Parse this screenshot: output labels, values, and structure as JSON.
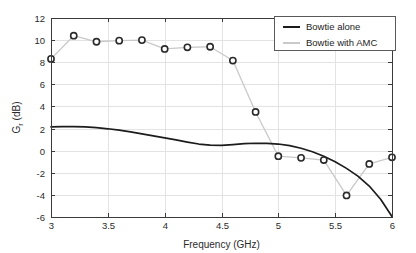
{
  "chart_data": {
    "type": "line",
    "title": "",
    "xlabel": "Frequency (GHz)",
    "ylabel": "G_r (dB)",
    "ylabel_base": "G",
    "ylabel_sub": "r",
    "ylabel_unit": " (dB)",
    "xlim": [
      3,
      6
    ],
    "ylim": [
      -6,
      12
    ],
    "xticks": [
      3,
      3.5,
      4,
      4.5,
      5,
      5.5,
      6
    ],
    "xtick_labels": [
      "3",
      "3.5",
      "4",
      "4.5",
      "5",
      "5.5",
      "6"
    ],
    "yticks": [
      -6,
      -4,
      -2,
      0,
      2,
      4,
      6,
      8,
      10,
      12
    ],
    "ytick_labels": [
      "-6",
      "-4",
      "-2",
      "0",
      "2",
      "4",
      "6",
      "8",
      "10",
      "12"
    ],
    "grid": true,
    "legend_position": "top-right",
    "series": [
      {
        "name": "Bowtie alone",
        "style": "solid",
        "color": "#1c1c1c",
        "marker": "none",
        "x": [
          3.0,
          3.1,
          3.2,
          3.3,
          3.4,
          3.5,
          3.6,
          3.7,
          3.8,
          3.9,
          4.0,
          4.1,
          4.2,
          4.3,
          4.4,
          4.5,
          4.6,
          4.7,
          4.8,
          4.9,
          5.0,
          5.1,
          5.2,
          5.3,
          5.4,
          5.5,
          5.6,
          5.7,
          5.8,
          5.9,
          6.0
        ],
        "values": [
          2.15,
          2.18,
          2.18,
          2.15,
          2.08,
          1.98,
          1.85,
          1.7,
          1.52,
          1.33,
          1.15,
          0.97,
          0.78,
          0.6,
          0.5,
          0.48,
          0.55,
          0.63,
          0.67,
          0.66,
          0.6,
          0.45,
          0.22,
          -0.1,
          -0.5,
          -1.0,
          -1.6,
          -2.3,
          -3.2,
          -4.4,
          -5.95
        ]
      },
      {
        "name": "Bowtie with AMC",
        "style": "solid-with-markers",
        "color": "#c9c9c9",
        "marker": "circle",
        "x": [
          3.0,
          3.2,
          3.4,
          3.6,
          3.8,
          4.0,
          4.2,
          4.4,
          4.6,
          4.8,
          5.0,
          5.2,
          5.4,
          5.6,
          5.8,
          6.0
        ],
        "values": [
          8.3,
          10.4,
          9.85,
          9.95,
          10.0,
          9.2,
          9.35,
          9.4,
          8.15,
          3.5,
          -0.5,
          -0.65,
          -0.85,
          -4.05,
          -1.2,
          -0.6
        ]
      }
    ]
  },
  "legend": {
    "entries": [
      {
        "label": "Bowtie alone"
      },
      {
        "label": "Bowtie with AMC"
      }
    ]
  }
}
